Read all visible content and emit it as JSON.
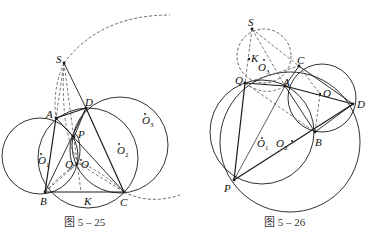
{
  "figures": [
    {
      "caption": "图 5 – 25",
      "points": {
        "S": "S",
        "A": "A",
        "D": "D",
        "P": "P",
        "Q": "Q",
        "O": "O",
        "B": "B",
        "C": "C",
        "K": "K",
        "O1": "O",
        "O1_sub": "1",
        "O2": "O",
        "O2_sub": "2",
        "O3": "O",
        "O3_sub": "3"
      }
    },
    {
      "caption": "图 5 – 26",
      "points": {
        "S": "S",
        "K": "K",
        "C": "C",
        "Q": "Q",
        "A": "A",
        "O": "O",
        "D": "D",
        "B": "B",
        "P": "P",
        "O1": "O",
        "O1_sub": "1",
        "O2": "O",
        "O2_sub": "2",
        "O3": "O",
        "O3_sub": "3"
      }
    }
  ],
  "colors": {
    "ink": "#1a1a1a",
    "dashed": "#555555",
    "background": "#ffffff"
  }
}
